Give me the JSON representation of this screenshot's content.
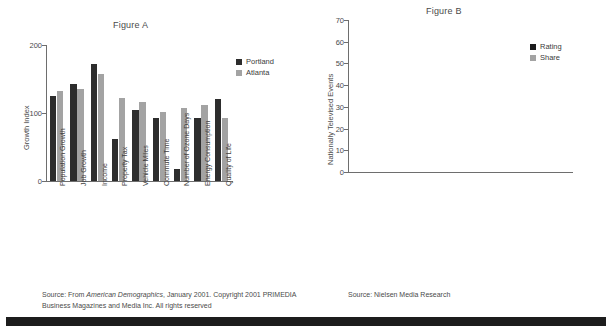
{
  "figureA": {
    "title": "Figure A",
    "ylabel": "Growth Index",
    "yticks": [
      "0",
      "100",
      "200"
    ],
    "legend": [
      {
        "label": "Portland",
        "color": "#2d2d2d"
      },
      {
        "label": "Atlanta",
        "color": "#a3a3a3"
      }
    ],
    "source_line1_prefix": "Source: From ",
    "source_line1_italic": "American Demographics",
    "source_line1_suffix": ", January 2001. Copyright 2001 PRIMEDIA",
    "source_line2": "Business Magazines and Media Inc. All rights reserved"
  },
  "figureB": {
    "title": "Figure B",
    "ylabel": "Nationally Televised Events",
    "yticks": [
      "0",
      "10",
      "20",
      "30",
      "40",
      "50",
      "60",
      "70"
    ],
    "legend": [
      {
        "label": "Rating",
        "color": "#1c1c1c"
      },
      {
        "label": "Share",
        "color": "#a3a3a3"
      }
    ],
    "source": "Source: Nielsen Media Research"
  },
  "chart_data": [
    {
      "type": "bar",
      "title": "Figure A",
      "xlabel": "",
      "ylabel": "Growth Index",
      "ylim": [
        0,
        200
      ],
      "yticks": [
        0,
        100,
        200
      ],
      "grid": false,
      "legend_position": "top-right",
      "categories": [
        "Population Growth",
        "Job Growth",
        "Income",
        "Property Tax",
        "Vehicle Miles",
        "Commute Time",
        "Number of Ozone Days",
        "Energy Consumption",
        "Quality of Life"
      ],
      "series": [
        {
          "name": "Portland",
          "color": "#2d2d2d",
          "values": [
            125,
            143,
            172,
            62,
            105,
            92,
            18,
            93,
            120
          ]
        },
        {
          "name": "Atlanta",
          "color": "#a3a3a3",
          "values": [
            132,
            136,
            158,
            122,
            116,
            101,
            108,
            112,
            92
          ]
        }
      ]
    },
    {
      "type": "area",
      "title": "Figure B",
      "xlabel": "",
      "ylabel": "Nationally Televised Events",
      "ylim": [
        0,
        70
      ],
      "yticks": [
        0,
        10,
        20,
        30,
        40,
        50,
        60,
        70
      ],
      "stacked": true,
      "grid": false,
      "legend_position": "top-right",
      "categories": [
        "MUSIC: Grammy Awards",
        "Country Music Awards",
        "ACTING: Academy Awards",
        "Golden Globes",
        "Emmy Awards",
        "People's Choice",
        "Daytime Emmy",
        "Tony Awards",
        "SPORTS: Super Bowl",
        "World Series Game 7",
        "AFC Championship",
        "NFC Championship"
      ],
      "series": [
        {
          "name": "Rating",
          "color": "#1c1c1c",
          "values": [
            19,
            13,
            28,
            17,
            14,
            12,
            11,
            9,
            43,
            27,
            26,
            24
          ]
        },
        {
          "name": "Share",
          "color": "#a3a3a3",
          "values": [
            9,
            8,
            11,
            8,
            7,
            7,
            8,
            8,
            16,
            10,
            18,
            22
          ]
        }
      ]
    }
  ]
}
